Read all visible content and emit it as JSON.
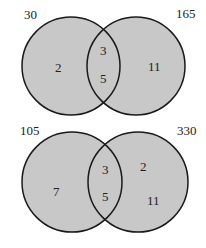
{
  "diagrams": [
    {
      "left_label": "30",
      "right_label": "165",
      "left_only": [
        "2"
      ],
      "intersection": [
        "3",
        "5"
      ],
      "right_only": [
        "11"
      ]
    },
    {
      "left_label": "105",
      "right_label": "330",
      "left_only": [
        "7"
      ],
      "intersection": [
        "3",
        "5"
      ],
      "right_only": [
        "2",
        "11"
      ]
    }
  ],
  "colors": {
    "fill": "#c8c8c8",
    "stroke": "#1a1a1a",
    "background": "#ffffff"
  }
}
